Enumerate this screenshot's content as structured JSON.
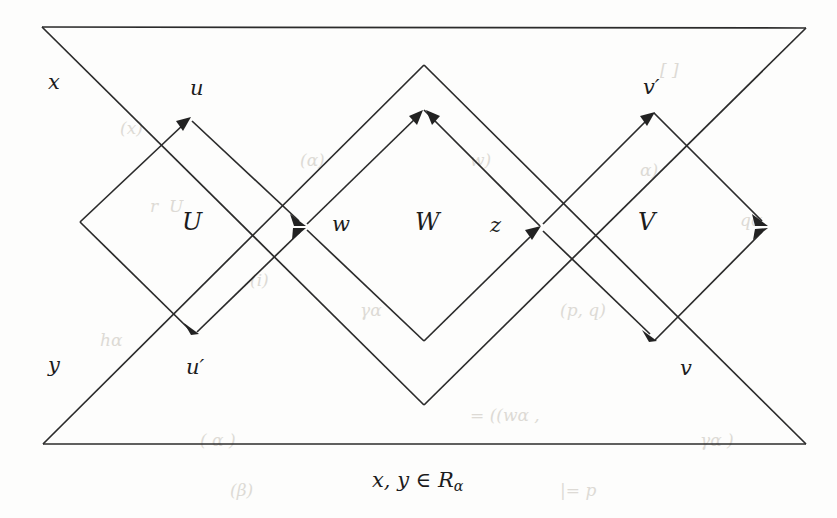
{
  "figure": {
    "type": "diagram",
    "caption": "x, y ∈ Rα",
    "caption_parts": {
      "vars": "x, y",
      "member": "∈",
      "set": "R",
      "subscript": "α"
    },
    "vertex_labels": [
      {
        "id": "x",
        "text": "x",
        "x": 48,
        "y": 72
      },
      {
        "id": "u",
        "text": "u",
        "x": 190,
        "y": 78
      },
      {
        "id": "vp",
        "text": "v′",
        "x": 643,
        "y": 77
      },
      {
        "id": "y",
        "text": "y",
        "x": 48,
        "y": 355
      },
      {
        "id": "up",
        "text": "u′",
        "x": 186,
        "y": 357
      },
      {
        "id": "v",
        "text": "v",
        "x": 680,
        "y": 358
      }
    ],
    "region_labels": [
      {
        "id": "U",
        "text": "U",
        "x": 182,
        "y": 210
      },
      {
        "id": "w",
        "text": "w",
        "x": 332,
        "y": 214
      },
      {
        "id": "W",
        "text": "W",
        "x": 415,
        "y": 210
      },
      {
        "id": "z",
        "text": "z",
        "x": 490,
        "y": 215
      },
      {
        "id": "V",
        "text": "V",
        "x": 638,
        "y": 210
      }
    ],
    "colors": {
      "ink": "#2b2b2b",
      "page": "#fdfdfc",
      "ghost": "#d8d5cf"
    },
    "geometry": {
      "outer_triangle_up": [
        [
          42,
          27
        ],
        [
          806,
          28
        ],
        [
          424,
          405
        ]
      ],
      "outer_triangle_down": [
        [
          43,
          444
        ],
        [
          806,
          444
        ],
        [
          424,
          65
        ]
      ],
      "diamond_U": [
        [
          80,
          222
        ],
        [
          190,
          118
        ],
        [
          305,
          226
        ],
        [
          192,
          332
        ]
      ],
      "diamond_W": [
        [
          305,
          226
        ],
        [
          424,
          110
        ],
        [
          540,
          226
        ],
        [
          424,
          341
        ]
      ],
      "diamond_V": [
        [
          540,
          226
        ],
        [
          654,
          113
        ],
        [
          768,
          226
        ],
        [
          655,
          340
        ]
      ],
      "arrow_targets": [
        "u",
        "u_prime",
        "w",
        "W_top",
        "z",
        "v_prime",
        "v",
        "right_apex"
      ]
    },
    "ghost_text": [
      {
        "t": "(x)",
        "x": 120,
        "y": 118
      },
      {
        "t": "r  U",
        "x": 150,
        "y": 196
      },
      {
        "t": "(α)",
        "x": 300,
        "y": 150
      },
      {
        "t": "(i)",
        "x": 250,
        "y": 270
      },
      {
        "t": "γα",
        "x": 360,
        "y": 300
      },
      {
        "t": "w)",
        "x": 470,
        "y": 150
      },
      {
        "t": "(p, q)",
        "x": 560,
        "y": 300
      },
      {
        "t": "α)",
        "x": 640,
        "y": 160
      },
      {
        "t": "qα",
        "x": 740,
        "y": 210
      },
      {
        "t": "( α )",
        "x": 200,
        "y": 430
      },
      {
        "t": "= ((wα ,",
        "x": 470,
        "y": 405
      },
      {
        "t": "γα )",
        "x": 700,
        "y": 430
      },
      {
        "t": "|= p",
        "x": 560,
        "y": 480
      },
      {
        "t": "(β)",
        "x": 230,
        "y": 480
      },
      {
        "t": "hα",
        "x": 100,
        "y": 330
      },
      {
        "t": "[ ]",
        "x": 660,
        "y": 60
      }
    ]
  }
}
